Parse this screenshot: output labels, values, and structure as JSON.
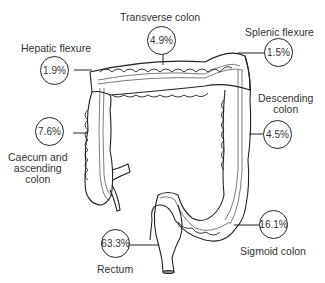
{
  "segments": [
    {
      "id": "transverse",
      "label": "Transverse colon",
      "percent": "4.9%"
    },
    {
      "id": "splenic",
      "label": "Splenic flexure",
      "percent": "1.5%"
    },
    {
      "id": "hepatic",
      "label": "Hepatic flexure",
      "percent": "1.9%"
    },
    {
      "id": "descending",
      "label": "Descending colon",
      "label_lines": [
        "Descending",
        "colon"
      ],
      "percent": "4.5%"
    },
    {
      "id": "caecum",
      "label": "Caecum and ascending colon",
      "label_lines": [
        "Caecum and",
        "ascending",
        "colon"
      ],
      "percent": "7.6%"
    },
    {
      "id": "sigmoid",
      "label": "Sigmoid colon",
      "percent": "16.1%"
    },
    {
      "id": "rectum",
      "label": "Rectum",
      "percent": "63.3%"
    }
  ]
}
